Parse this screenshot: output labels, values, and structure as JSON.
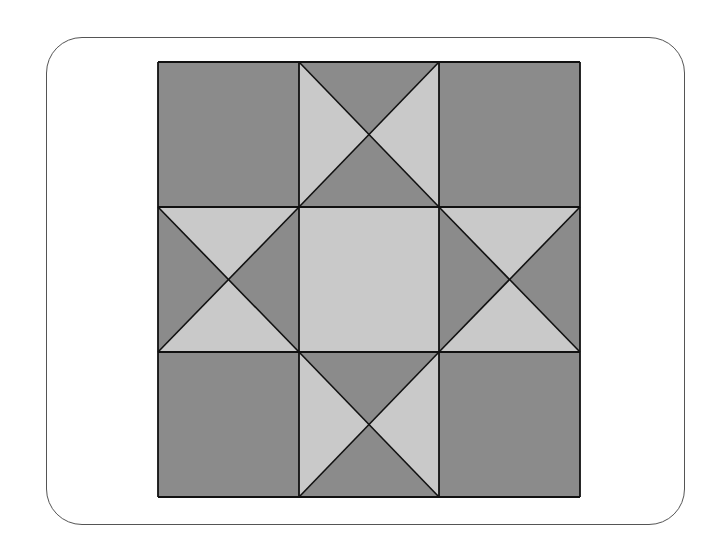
{
  "diagram": {
    "type": "quilt-block",
    "pattern": "Ohio Star",
    "grid": {
      "rows": 3,
      "cols": 3
    },
    "bounds": {
      "x0": 158,
      "y0": 62,
      "x1": 580,
      "y1": 497
    },
    "col_lines": [
      158,
      299,
      439,
      580
    ],
    "row_lines": [
      62,
      207,
      352,
      497
    ],
    "colors": {
      "light": "#c9c9c9",
      "dark": "#8b8b8b",
      "stroke": "#111111",
      "frame": "#555555"
    },
    "cells": [
      {
        "row": 0,
        "col": 0,
        "kind": "solid",
        "fill": "dark"
      },
      {
        "row": 0,
        "col": 1,
        "kind": "hourglass",
        "top": "dark",
        "bottom": "dark",
        "left": "light",
        "right": "light"
      },
      {
        "row": 0,
        "col": 2,
        "kind": "solid",
        "fill": "dark"
      },
      {
        "row": 1,
        "col": 0,
        "kind": "hourglass",
        "top": "light",
        "bottom": "light",
        "left": "dark",
        "right": "dark"
      },
      {
        "row": 1,
        "col": 1,
        "kind": "solid",
        "fill": "light"
      },
      {
        "row": 1,
        "col": 2,
        "kind": "hourglass",
        "top": "light",
        "bottom": "light",
        "left": "dark",
        "right": "dark"
      },
      {
        "row": 2,
        "col": 0,
        "kind": "solid",
        "fill": "dark"
      },
      {
        "row": 2,
        "col": 1,
        "kind": "hourglass",
        "top": "dark",
        "bottom": "dark",
        "left": "light",
        "right": "light"
      },
      {
        "row": 2,
        "col": 2,
        "kind": "solid",
        "fill": "dark"
      }
    ]
  }
}
